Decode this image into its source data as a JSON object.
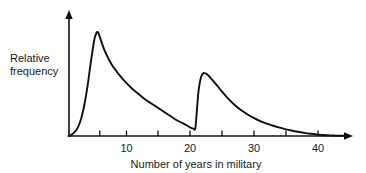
{
  "chart_data": {
    "type": "line",
    "title": "",
    "subtitle": "",
    "xlabel": "Number of years in military",
    "ylabel": "Relative frequency",
    "ylabel_line1": "Relative",
    "ylabel_line2": "frequency",
    "xlim": [
      0,
      44.5
    ],
    "ylim": [
      0,
      1.05
    ],
    "grid": false,
    "legend": null,
    "annotations": [],
    "x_tick_labels": [
      "10",
      "20",
      "30",
      "40"
    ],
    "x_tick_label_values": [
      10,
      20,
      30,
      40
    ],
    "x_tick_values_all": [
      5,
      10,
      15,
      20,
      25,
      30,
      35,
      40
    ],
    "y_tick_labels": [],
    "axis_color": "#101010",
    "curve_color": "#101010",
    "background_color": "#ffffff",
    "series": [
      {
        "name": "Relative frequency",
        "x": [
          0,
          0.5,
          1,
          1.5,
          2,
          2.5,
          3,
          3.5,
          4,
          4.3,
          4.6,
          5,
          5.5,
          6,
          6.5,
          7,
          7.5,
          8,
          9,
          10,
          11,
          12,
          13,
          14,
          15,
          16,
          17,
          18,
          19,
          19.6,
          19.9,
          20.1,
          20.4,
          20.8,
          21.2,
          21.8,
          22.5,
          23.2,
          24,
          25,
          26,
          27,
          28,
          29,
          30,
          31,
          32,
          33,
          34,
          35,
          36,
          37,
          38,
          39,
          40,
          41,
          42,
          43,
          44
        ],
        "y": [
          0,
          0.015,
          0.04,
          0.085,
          0.17,
          0.3,
          0.48,
          0.7,
          0.9,
          0.97,
          0.99,
          0.93,
          0.84,
          0.77,
          0.71,
          0.66,
          0.62,
          0.58,
          0.51,
          0.45,
          0.4,
          0.35,
          0.31,
          0.27,
          0.23,
          0.19,
          0.15,
          0.12,
          0.085,
          0.07,
          0.07,
          0.2,
          0.42,
          0.56,
          0.6,
          0.585,
          0.54,
          0.49,
          0.43,
          0.36,
          0.3,
          0.25,
          0.21,
          0.175,
          0.145,
          0.12,
          0.1,
          0.082,
          0.066,
          0.052,
          0.04,
          0.03,
          0.022,
          0.015,
          0.01,
          0.006,
          0.004,
          0.002,
          0.001
        ],
        "peaks": [
          {
            "x": 4.6,
            "y": 0.99,
            "label": "first mode"
          },
          {
            "x": 21.2,
            "y": 0.6,
            "label": "second mode"
          }
        ],
        "valley": {
          "x": 19.8,
          "y": 0.07
        }
      }
    ]
  },
  "figure": {
    "xlabel": "Number of years in military",
    "ylabel_line1": "Relative",
    "ylabel_line2": "frequency",
    "ticks": [
      {
        "value": 10,
        "label": "10"
      },
      {
        "value": 20,
        "label": "20"
      },
      {
        "value": 30,
        "label": "30"
      },
      {
        "value": 40,
        "label": "40"
      }
    ]
  }
}
